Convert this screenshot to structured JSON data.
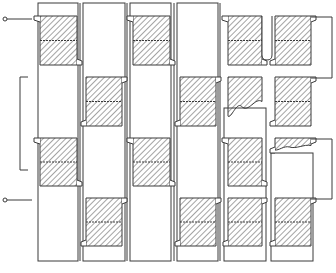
{
  "diagram": {
    "type": "patent-style cross-section drawing",
    "colors": {
      "background": "#ffffff",
      "stroke": "#3a3a3a",
      "hatch": "#4a4a4a"
    },
    "terminals": [
      {
        "name": "terminal-top-left",
        "x": 5,
        "y": 19
      },
      {
        "name": "terminal-bottom-left",
        "x": 5,
        "y": 200
      }
    ],
    "columns": [
      {
        "name": "column-1",
        "x": 38,
        "y": 3,
        "w": 40,
        "h": 258
      },
      {
        "name": "column-2",
        "x": 83,
        "y": 3,
        "w": 42,
        "h": 258
      },
      {
        "name": "column-3",
        "x": 130,
        "y": 3,
        "w": 41,
        "h": 258
      },
      {
        "name": "column-4",
        "x": 177,
        "y": 3,
        "w": 41,
        "h": 258
      },
      {
        "name": "column-5",
        "x": 224,
        "y": 108,
        "w": 42,
        "h": 153
      },
      {
        "name": "column-6",
        "x": 271,
        "y": 153,
        "w": 42,
        "h": 108
      }
    ],
    "blocks": [
      {
        "name": "block-c1-a",
        "x": 40,
        "y": 16,
        "w": 37,
        "h": 49,
        "tab": "left-top",
        "broken": false
      },
      {
        "name": "block-c1-c",
        "x": 40,
        "y": 138,
        "w": 37,
        "h": 48,
        "tab": "left-top",
        "broken": false
      },
      {
        "name": "block-c2-b",
        "x": 86,
        "y": 77,
        "w": 36,
        "h": 49,
        "tab": "right-top",
        "broken": false
      },
      {
        "name": "block-c2-d",
        "x": 86,
        "y": 198,
        "w": 36,
        "h": 48,
        "tab": "right-top",
        "broken": false
      },
      {
        "name": "block-c3-a",
        "x": 133,
        "y": 16,
        "w": 37,
        "h": 49,
        "tab": "left-top",
        "broken": false
      },
      {
        "name": "block-c3-c",
        "x": 133,
        "y": 138,
        "w": 37,
        "h": 48,
        "tab": "left-top",
        "broken": false
      },
      {
        "name": "block-c4-b",
        "x": 180,
        "y": 77,
        "w": 36,
        "h": 49,
        "tab": "right-top",
        "broken": false
      },
      {
        "name": "block-c4-d",
        "x": 180,
        "y": 198,
        "w": 36,
        "h": 48,
        "tab": "right-top",
        "broken": false
      },
      {
        "name": "block-c5-a",
        "x": 228,
        "y": 16,
        "w": 34,
        "h": 49,
        "tab": "left-top",
        "broken": false
      },
      {
        "name": "block-c5-b",
        "x": 228,
        "y": 77,
        "w": 34,
        "h": 49,
        "tab": "none",
        "broken": true
      },
      {
        "name": "block-c5-c",
        "x": 228,
        "y": 138,
        "w": 34,
        "h": 48,
        "tab": "left-top",
        "broken": false
      },
      {
        "name": "block-c5-d",
        "x": 228,
        "y": 198,
        "w": 34,
        "h": 48,
        "tab": "right-top",
        "broken": false
      },
      {
        "name": "block-c6-a",
        "x": 275,
        "y": 16,
        "w": 36,
        "h": 49,
        "tab": "right-top",
        "broken": false
      },
      {
        "name": "block-c6-b",
        "x": 275,
        "y": 77,
        "w": 36,
        "h": 49,
        "tab": "right-top",
        "broken": false
      },
      {
        "name": "block-c6-c",
        "x": 275,
        "y": 138,
        "w": 36,
        "h": 15,
        "tab": "right-top",
        "broken": true
      },
      {
        "name": "block-c6-d",
        "x": 275,
        "y": 198,
        "w": 36,
        "h": 48,
        "tab": "right-top",
        "broken": false
      }
    ],
    "leads": [
      {
        "name": "lead-left-upper",
        "points": "28,77 20,77 20,170 28,170"
      },
      {
        "name": "lead-right-upper",
        "points": "311,17 332,17 332,78 311,78"
      },
      {
        "name": "lead-right-lower",
        "points": "311,139 332,139 332,199 311,199"
      }
    ]
  }
}
